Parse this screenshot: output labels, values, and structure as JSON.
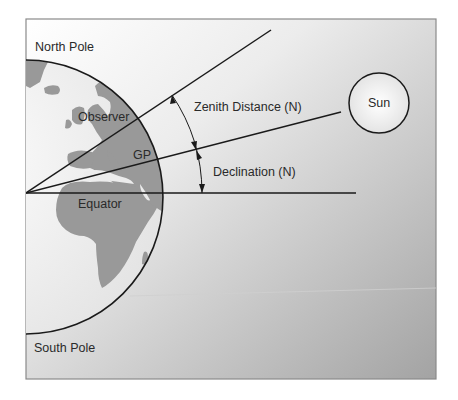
{
  "diagram": {
    "labels": {
      "north_pole": "North Pole",
      "south_pole": "South Pole",
      "observer": "Observer",
      "gp": "GP",
      "equator": "Equator",
      "zenith_distance": "Zenith Distance (N)",
      "declination": "Declination (N)",
      "sun": "Sun"
    },
    "colors": {
      "background_top": "#ffffff",
      "background_bottom": "#a3a3a3",
      "land": "#999999",
      "ocean": "#f4f4f4",
      "line": "#1a1a1a",
      "frame": "#8a8a8a"
    }
  }
}
